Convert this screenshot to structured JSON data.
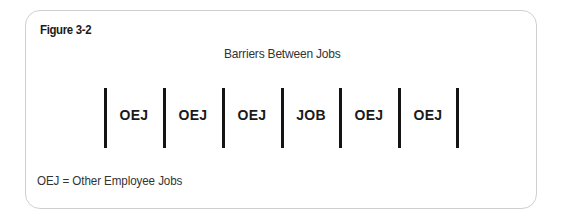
{
  "figure": {
    "label": "Figure 3-2",
    "title": "Barriers Between Jobs",
    "footnote": "OEJ = Other Employee Jobs"
  },
  "diagram": {
    "cells": [
      {
        "label": "OEJ"
      },
      {
        "label": "OEJ"
      },
      {
        "label": "OEJ"
      },
      {
        "label": "JOB"
      },
      {
        "label": "OEJ"
      },
      {
        "label": "OEJ"
      }
    ],
    "barrier_count": 7,
    "colors": {
      "barrier": "#141414",
      "frame_border": "#cfcfcf",
      "text": "#1a1a1a"
    }
  }
}
